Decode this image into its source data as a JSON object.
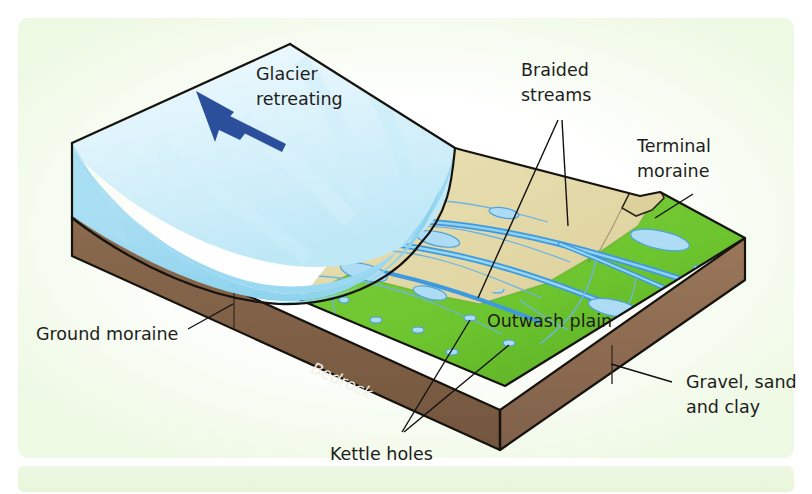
{
  "figure": {
    "type": "geological-block-diagram"
  },
  "colors": {
    "panel_background": "#f3fbeb",
    "ice_light": "#e8f7fc",
    "ice_mid": "#bfe9f7",
    "ice_shade": "#8fd6ef",
    "sand": "#e2d9a8",
    "sand_dark": "#d2c690",
    "grass": "#72c733",
    "grass_dark": "#5ba828",
    "bedrock": "#7d5f46",
    "bedrock_dark": "#6b4f38",
    "water": "#7ec8ec",
    "water_line": "#3d9ae0",
    "arrow": "#2c4f9c",
    "label_text": "#1d1d1b",
    "bedrock_text": "#f2efe6",
    "outline": "#16130f"
  },
  "labels": {
    "glacier_retreating": {
      "line1": "Glacier",
      "line2": "retreating"
    },
    "braided_streams": {
      "line1": "Braided",
      "line2": "streams"
    },
    "terminal_moraine": {
      "line1": "Terminal",
      "line2": "moraine"
    },
    "outwash_plain": "Outwash plain",
    "ground_moraine": "Ground moraine",
    "bedrock": "Bedrock",
    "kettle_holes": "Kettle holes",
    "gravel_sand_clay": {
      "line1": "Gravel, sand",
      "line2": "and clay"
    }
  },
  "icons": {
    "direction_arrow": "arrow-up-left-icon"
  },
  "features": [
    {
      "name": "glacier",
      "description": "Retreating ice sheet occupying the left half of the block"
    },
    {
      "name": "outwash-plain",
      "description": "Tan sand and gravel plain in front of the ice"
    },
    {
      "name": "terminal-moraine",
      "description": "Ridge marking the former ice margin"
    },
    {
      "name": "braided-streams",
      "description": "Meltwater channels crossing the outwash plain"
    },
    {
      "name": "kettle-holes",
      "description": "Small water-filled depressions in the ground moraine"
    },
    {
      "name": "ground-moraine",
      "description": "Till layer beneath the ice and plain"
    },
    {
      "name": "bedrock",
      "description": "Basal rock slab forming the base of the block"
    }
  ]
}
